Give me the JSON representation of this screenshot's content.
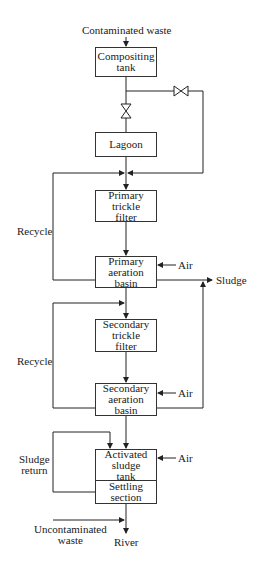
{
  "diagram": {
    "type": "process-flow",
    "inputs": {
      "contaminated_waste": "Contaminated waste",
      "uncontaminated_waste": "Uncontaminated\nwaste"
    },
    "units": {
      "compositing_tank": "Compositing\ntank",
      "lagoon": "Lagoon",
      "primary_trickle_filter": "Primary\ntrickle\nfilter",
      "primary_aeration_basin": "Primary\naeration\nbasin",
      "secondary_trickle_filter": "Secondary\ntrickle\nfilter",
      "secondary_aeration_basin": "Secondary\naeration\nbasin",
      "activated_sludge_tank": "Activated\nsludge\ntank",
      "settling_section": "Settling\nsection"
    },
    "labels": {
      "air_1": "Air",
      "air_2": "Air",
      "air_3": "Air",
      "sludge": "Sludge",
      "recycle_1": "Recycle",
      "recycle_2": "Recycle",
      "sludge_return": "Sludge\nreturn",
      "river": "River"
    },
    "icons": [
      "valve-icon",
      "valve-icon",
      "arrow-icon"
    ]
  }
}
